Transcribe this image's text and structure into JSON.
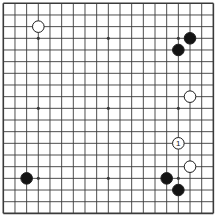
{
  "diagram": {
    "type": "go-board",
    "size": 19
  },
  "board": {
    "size": 19,
    "origin_x": 3.3,
    "origin_y": 3.3,
    "spacing": 11.67,
    "edge_width": 1.6,
    "line_width": 0.9,
    "star_radius": 1.6,
    "stone_radius": 5.8,
    "star_points": [
      [
        3,
        3
      ],
      [
        9,
        3
      ],
      [
        15,
        3
      ],
      [
        3,
        9
      ],
      [
        9,
        9
      ],
      [
        15,
        9
      ],
      [
        3,
        15
      ],
      [
        9,
        15
      ],
      [
        15,
        15
      ]
    ],
    "stones": [
      {
        "color": "white",
        "col": 3,
        "row": 2,
        "label": ""
      },
      {
        "color": "black",
        "col": 16,
        "row": 3,
        "label": ""
      },
      {
        "color": "black",
        "col": 15,
        "row": 4,
        "label": ""
      },
      {
        "color": "white",
        "col": 16,
        "row": 8,
        "label": ""
      },
      {
        "color": "white",
        "col": 15,
        "row": 12,
        "label": "1"
      },
      {
        "color": "white",
        "col": 16,
        "row": 14,
        "label": ""
      },
      {
        "color": "black",
        "col": 14,
        "row": 15,
        "label": ""
      },
      {
        "color": "black",
        "col": 15,
        "row": 16,
        "label": ""
      },
      {
        "color": "black",
        "col": 2,
        "row": 15,
        "label": ""
      }
    ]
  },
  "colors": {
    "background": "#ffffff",
    "grid_line": "#3a3a3a",
    "black_stone": "#141414",
    "white_stone": "#ffffff",
    "stone_outline": "#1e1e1e",
    "label_text": "#111111"
  }
}
